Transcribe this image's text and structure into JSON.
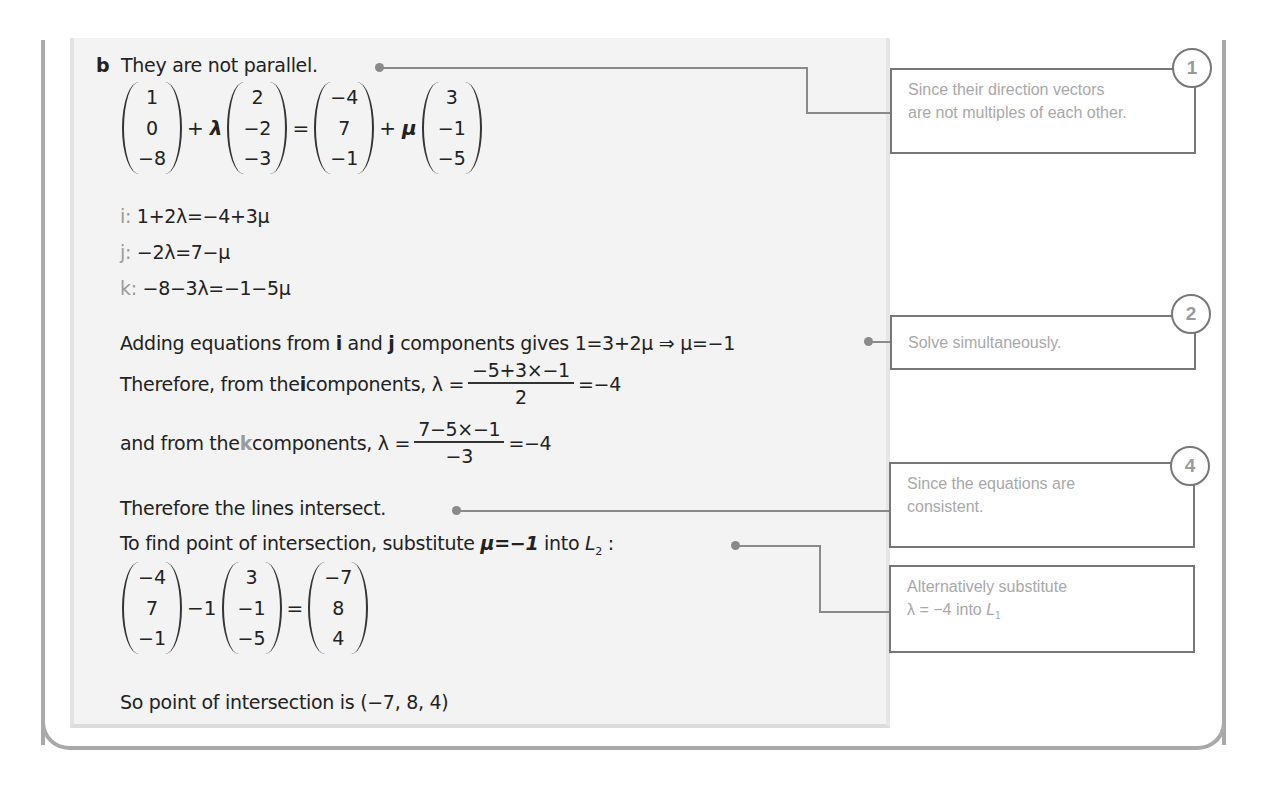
{
  "part_label": "b",
  "solution": {
    "line1": "They are not parallel.",
    "vector_equation": {
      "a": [
        "1",
        "0",
        "−8"
      ],
      "lambda_symbol": "λ",
      "d1": [
        "2",
        "−2",
        "−3"
      ],
      "b": [
        "−4",
        "7",
        "−1"
      ],
      "mu_symbol": "μ",
      "d2": [
        "3",
        "−1",
        "−5"
      ],
      "plus": "+",
      "equals": "="
    },
    "components": [
      {
        "label": "i",
        "sep": ":",
        "equation": "1+2λ=−4+3μ"
      },
      {
        "label": "j",
        "sep": ":",
        "equation": "−2λ=7−μ"
      },
      {
        "label": "k",
        "sep": ":",
        "equation": "−8−3λ=−1−5μ"
      }
    ],
    "adding": {
      "prefix": "Adding equations from ",
      "i": "i",
      "and": " and ",
      "j": "j",
      "suffix": " components gives 1=3+2μ ⇒ μ=−1"
    },
    "from_i": {
      "prefix": "Therefore, from the ",
      "i": "i",
      "suffix": " components, λ =",
      "numerator": "−5+3×−1",
      "denominator": "2",
      "result": "=−4"
    },
    "from_k": {
      "prefix": "and from the ",
      "k": "k",
      "suffix": " components, λ =",
      "numerator": "7−5×−1",
      "denominator": "−3",
      "result": "=−4"
    },
    "intersect": "Therefore the lines intersect.",
    "substitute": {
      "text": "To find point of intersection, substitute ",
      "mu_eq": "μ=−1",
      "into": " into ",
      "line": "L",
      "line_sub": "2",
      "colon": " :"
    },
    "substitution": {
      "b": [
        "−4",
        "7",
        "−1"
      ],
      "coef": "−1",
      "d2": [
        "3",
        "−1",
        "−5"
      ],
      "equals": "=",
      "result": [
        "−7",
        "8",
        "4"
      ]
    },
    "conclusion": "So point of intersection is (−7, 8, 4)"
  },
  "notes": [
    {
      "badge": "1",
      "text_line1": "Since their direction vectors",
      "text_line2": "are not multiples of each other."
    },
    {
      "badge": "2",
      "text_line1": "Solve simultaneously."
    },
    {
      "badge": "4",
      "text_line1": "Since the equations are",
      "text_line2": "consistent."
    },
    {
      "text_line1": "Alternatively substitute",
      "text_line2_prefix": "λ = −4 into ",
      "line": "L",
      "line_sub": "1"
    }
  ],
  "colors": {
    "panel_bg": "#f3f3f3",
    "frame": "#a9a9a9",
    "note_text": "#a8a8a8",
    "component_label": "#9a9a9a"
  }
}
